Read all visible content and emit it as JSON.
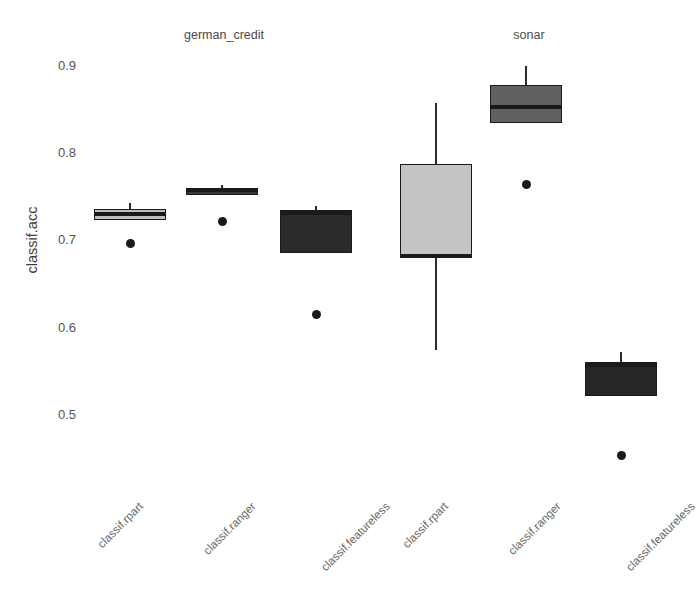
{
  "page": {
    "top_clipped_text": "·        ·        ·",
    "background_color": "#ffffff"
  },
  "chart_data": {
    "type": "box",
    "title": "",
    "subtitle": "",
    "xlabel": "",
    "ylabel": "classif.acc",
    "ylim": [
      0.44,
      0.92
    ],
    "yticks": [
      0.9,
      0.8,
      0.7,
      0.6,
      0.5
    ],
    "ytick_labels": [
      "0.9",
      "0.8",
      "0.7",
      "0.6",
      "0.5"
    ],
    "grid": false,
    "legend": "none",
    "facet_variable": "task",
    "facets": [
      {
        "name": "german_credit",
        "label": "german_credit",
        "categories": [
          "classif.rpart",
          "classif.ranger",
          "classif.featureless"
        ],
        "boxes": [
          {
            "category": "classif.rpart",
            "whisker_low": 0.722,
            "q1": 0.722,
            "median": 0.729,
            "q3": 0.735,
            "whisker_high": 0.742,
            "outliers": [
              0.695
            ],
            "fill": "#bfbfbf"
          },
          {
            "category": "classif.ranger",
            "whisker_low": 0.751,
            "q1": 0.751,
            "median": 0.757,
            "q3": 0.758,
            "whisker_high": 0.762,
            "outliers": [
              0.721
            ],
            "fill": "#3a3a3a"
          },
          {
            "category": "classif.featureless",
            "whisker_low": 0.685,
            "q1": 0.685,
            "median": 0.731,
            "q3": 0.732,
            "whisker_high": 0.738,
            "outliers": [
              0.614
            ],
            "fill": "#2a2a2a"
          }
        ]
      },
      {
        "name": "sonar",
        "label": "sonar",
        "categories": [
          "classif.rpart",
          "classif.ranger",
          "classif.featureless"
        ],
        "boxes": [
          {
            "category": "classif.rpart",
            "whisker_low": 0.573,
            "q1": 0.681,
            "median": 0.681,
            "q3": 0.786,
            "whisker_high": 0.856,
            "outliers": [],
            "fill": "#c4c4c4"
          },
          {
            "category": "classif.ranger",
            "whisker_low": 0.833,
            "q1": 0.833,
            "median": 0.852,
            "q3": 0.877,
            "whisker_high": 0.899,
            "outliers": [
              0.763
            ],
            "fill": "#606060"
          },
          {
            "category": "classif.featureless",
            "whisker_low": 0.521,
            "q1": 0.521,
            "median": 0.556,
            "q3": 0.56,
            "whisker_high": 0.571,
            "outliers": [
              0.452
            ],
            "fill": "#262626"
          }
        ]
      }
    ]
  }
}
